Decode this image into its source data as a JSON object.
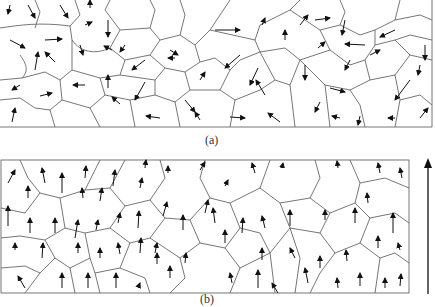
{
  "figure": {
    "panels": [
      {
        "id": "a",
        "label": "(a)",
        "description": "Randomly oriented grains (domains) with magnetization arrows in random directions"
      },
      {
        "id": "b",
        "label": "(b)",
        "description": "Grains with magnetization arrows aligned predominantly upward"
      }
    ],
    "field_arrow": {
      "direction": "up",
      "description": "Applied field direction indicator"
    },
    "colors": {
      "line": "#555555",
      "arrow": "#111111",
      "background": "#ffffff"
    }
  }
}
